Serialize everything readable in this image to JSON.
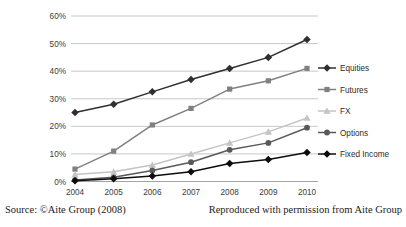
{
  "chart_data": {
    "type": "line",
    "title": "",
    "xlabel": "",
    "ylabel": "",
    "categories": [
      "2004",
      "2005",
      "2006",
      "2007",
      "2008",
      "2009",
      "2010"
    ],
    "ylim": [
      0,
      60
    ],
    "yticks": [
      0,
      10,
      20,
      30,
      40,
      50,
      60
    ],
    "ytick_labels": [
      "0%",
      "10%",
      "20%",
      "30%",
      "40%",
      "50%",
      "60%"
    ],
    "grid": true,
    "legend_position": "right",
    "value_suffix": "%",
    "series": [
      {
        "name": "Equities",
        "marker": "diamond",
        "color": "#2f2f2f",
        "values": [
          25.0,
          28.0,
          32.5,
          37.0,
          41.0,
          45.0,
          51.5
        ]
      },
      {
        "name": "Futures",
        "marker": "square",
        "color": "#808080",
        "values": [
          4.5,
          11.0,
          20.5,
          26.5,
          33.5,
          36.5,
          41.0
        ]
      },
      {
        "name": "FX",
        "marker": "triangle",
        "color": "#c4c4c4",
        "values": [
          2.5,
          3.5,
          6.0,
          10.0,
          14.0,
          18.0,
          23.0
        ]
      },
      {
        "name": "Options",
        "marker": "circle",
        "color": "#595959",
        "values": [
          0.5,
          1.5,
          4.0,
          7.0,
          11.5,
          14.0,
          19.5
        ]
      },
      {
        "name": "Fixed Income",
        "marker": "diamond",
        "color": "#0d0d0d",
        "values": [
          0.3,
          1.0,
          2.0,
          3.5,
          6.5,
          8.0,
          10.5
        ]
      }
    ]
  },
  "caption": {
    "source": "Source: ©Aite Group (2008)",
    "permission": "Reproduced with permission from Aite Group"
  }
}
